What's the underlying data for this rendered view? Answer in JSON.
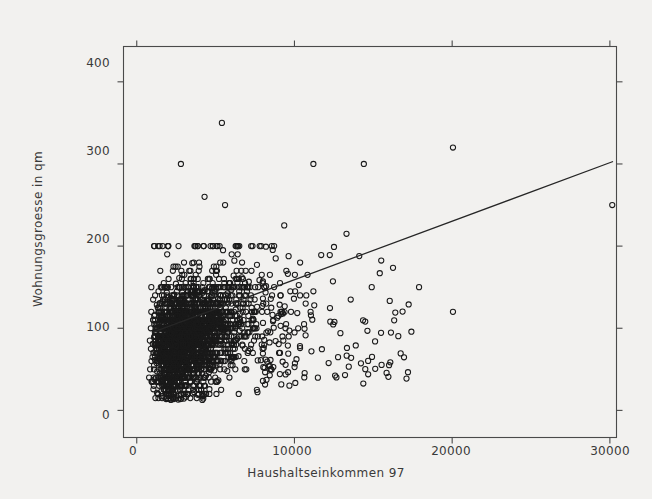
{
  "chart_data": {
    "type": "scatter",
    "title": "",
    "xlabel": "Haushaltseinkommen 97",
    "ylabel": "Wohnungsgroesse in qm",
    "xlim": [
      -840,
      30420
    ],
    "ylim": [
      -33,
      443
    ],
    "xticks": [
      0,
      10000,
      20000,
      30000
    ],
    "xtick_labels": [
      "0",
      "10000",
      "20000",
      "30000"
    ],
    "yticks": [
      0,
      100,
      200,
      300,
      400
    ],
    "ytick_labels": [
      "0",
      "100",
      "200",
      "300",
      "400"
    ],
    "grid": false,
    "legend": null,
    "marker": "open-circle",
    "marker_size": 4,
    "point_color": "#1a1a1a",
    "line_color": "#262626",
    "frame_color": "#4a4a4a",
    "background": "#f2f1ef",
    "n_points": 2480,
    "regression_line": {
      "label": "linear fit",
      "x_start": 1000,
      "y_start": 95,
      "x_end": 30200,
      "y_end": 303,
      "slope": 0.00712,
      "intercept": 87.9
    },
    "cluster": {
      "description": "dense cloud of household observations",
      "x_core_range": [
        300,
        8000
      ],
      "y_core_range": [
        15,
        150
      ],
      "x_peak": 3200,
      "y_peak": 75
    },
    "notable_outliers": [
      {
        "x": 5400,
        "y": 350
      },
      {
        "x": 20050,
        "y": 320
      },
      {
        "x": 2800,
        "y": 300
      },
      {
        "x": 11200,
        "y": 300
      },
      {
        "x": 14400,
        "y": 300
      },
      {
        "x": 30150,
        "y": 250
      },
      {
        "x": 4300,
        "y": 260
      },
      {
        "x": 5600,
        "y": 250
      },
      {
        "x": 13300,
        "y": 215
      },
      {
        "x": 17900,
        "y": 150
      },
      {
        "x": 20050,
        "y": 120
      },
      {
        "x": 14900,
        "y": 150
      },
      {
        "x": 16000,
        "y": 55
      }
    ]
  },
  "axes": {
    "x_title": "Haushaltseinkommen 97",
    "y_title": "Wohnungsgroesse in qm",
    "x_labels": [
      "0",
      "10000",
      "20000",
      "30000"
    ],
    "y_labels": [
      "400",
      "300",
      "200",
      "100",
      "0"
    ]
  }
}
